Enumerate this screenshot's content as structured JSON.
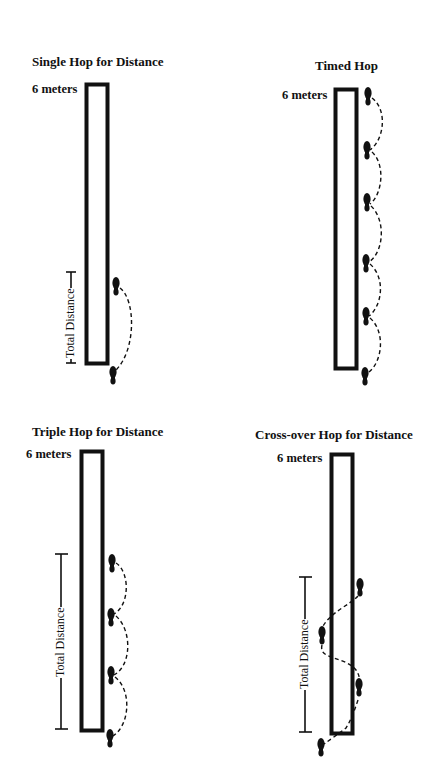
{
  "figure": {
    "panels": [
      {
        "id": "single-hop",
        "title": "Single Hop for Distance",
        "distance_label": "6 meters",
        "measure_label": "Total Distance",
        "hop_count": 1,
        "footprints": 2
      },
      {
        "id": "timed-hop",
        "title": "Timed Hop",
        "distance_label": "6 meters",
        "measure_label": "",
        "hop_count": 5,
        "footprints": 6
      },
      {
        "id": "triple-hop",
        "title": "Triple Hop for Distance",
        "distance_label": "6 meters",
        "measure_label": "Total Distance",
        "hop_count": 3,
        "footprints": 4
      },
      {
        "id": "cross-over-hop",
        "title": "Cross-over Hop for Distance",
        "distance_label": "6 meters",
        "measure_label": "Total Distance",
        "hop_count": 3,
        "footprints": 4
      }
    ],
    "colors": {
      "ink": "#111111",
      "background": "#ffffff"
    }
  }
}
